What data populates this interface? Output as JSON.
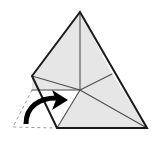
{
  "figure": {
    "canvas": {
      "width": 158,
      "height": 142
    },
    "colors": {
      "background": "#ffffff",
      "paper_fill": "#e6e6e6",
      "flap_fill": "#ffffff",
      "outline": "#1a1a1a",
      "fold_line": "#4d4d4d",
      "ghost_dash": "#9a9a9a",
      "arrow": "#000000"
    },
    "points": {
      "apex": [
        80,
        12
      ],
      "left_fold_vertex": [
        32,
        76
      ],
      "left_mid_vertex": [
        32,
        90
      ],
      "bottom_left": [
        57,
        128
      ],
      "bottom_right": [
        147,
        128
      ],
      "right_mid_vertex": [
        112,
        74
      ],
      "center": [
        80,
        90
      ]
    },
    "outline_path": "M80,12 L32,76 L57,128 L147,128 Z",
    "fold_lines": [
      {
        "name": "center-to-apex",
        "from": [
          80,
          90
        ],
        "to": [
          80,
          12
        ]
      },
      {
        "name": "center-to-left-fold-vertex",
        "from": [
          80,
          90
        ],
        "to": [
          32,
          76
        ]
      },
      {
        "name": "center-to-left-mid",
        "from": [
          80,
          90
        ],
        "to": [
          32,
          90
        ]
      },
      {
        "name": "center-to-bottom-left",
        "from": [
          80,
          90
        ],
        "to": [
          57,
          128
        ]
      },
      {
        "name": "center-to-bottom-right",
        "from": [
          80,
          90
        ],
        "to": [
          147,
          128
        ]
      },
      {
        "name": "center-to-right-mid",
        "from": [
          80,
          90
        ],
        "to": [
          112,
          74
        ]
      }
    ],
    "shaded_regions": [
      {
        "name": "upper-left-sector",
        "path": "M80,12 L32,76 L80,90 Z"
      },
      {
        "name": "upper-right-sector",
        "path": "M80,12 L80,90 L112,74 Z"
      },
      {
        "name": "right-sector",
        "path": "M112,74 L80,90 L147,128 Z"
      },
      {
        "name": "bottom-right-sector",
        "path": "M80,90 L57,128 L147,128 Z"
      },
      {
        "name": "left-small-sector",
        "path": "M32,76 L32,90 L80,90 Z"
      }
    ],
    "white_regions": [
      {
        "name": "folded-flap-sector",
        "path": "M32,90 L57,128 L80,90 Z"
      }
    ],
    "ghost_outline": {
      "name": "unfolded-flap-ghost",
      "path": "M32,90 L13,127 L57,128",
      "dash": "3,3"
    },
    "arrow": {
      "name": "fold-direction-arrow",
      "curve": "M26,124 C26,106 40,98 56,98",
      "head": "M52,90 L68,100 L52,110 L56,100 Z",
      "stroke_width": 5
    }
  }
}
